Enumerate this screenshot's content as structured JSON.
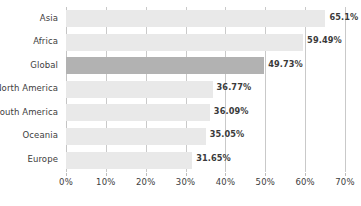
{
  "chart_data": {
    "type": "bar",
    "orientation": "horizontal",
    "title": "",
    "subtitle": "",
    "xlabel": "",
    "ylabel": "",
    "categories": [
      "Asia",
      "Africa",
      "Global",
      "North America",
      "South America",
      "Oceania",
      "Europe"
    ],
    "values": [
      65.1,
      59.49,
      49.73,
      36.77,
      36.09,
      35.05,
      31.65
    ],
    "value_labels": [
      "65.1%",
      "59.49%",
      "49.73%",
      "36.77%",
      "36.09%",
      "35.05%",
      "31.65%"
    ],
    "highlighted_category": "Global",
    "xlim": [
      0,
      70
    ],
    "xticks": [
      0,
      10,
      20,
      30,
      40,
      50,
      60,
      70
    ],
    "xtick_labels": [
      "0%",
      "10%",
      "20%",
      "30%",
      "40%",
      "50%",
      "60%",
      "70%"
    ],
    "grid": "vertical",
    "legend": "none",
    "colors": {
      "bar": "#e9e9e9",
      "bar_highlight": "#b2b2b2",
      "gridline": "#c9c9c9",
      "text": "#3d3d3d",
      "value_text": "#3a3a3a",
      "background": "#ffffff"
    }
  }
}
